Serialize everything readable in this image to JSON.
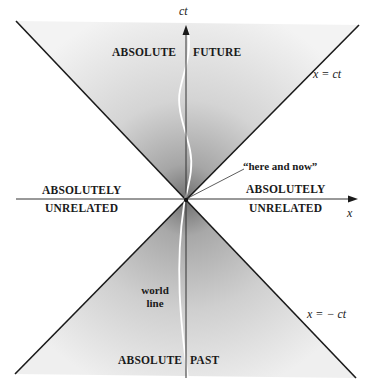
{
  "diagram": {
    "axes": {
      "vertical_label": "ct",
      "horizontal_label": "x"
    },
    "cone_lines": {
      "future_boundary": "x = ct",
      "past_boundary": "x = − ct"
    },
    "regions": {
      "future_left": "ABSOLUTE",
      "future_right": "FUTURE",
      "past_left": "ABSOLUTE",
      "past_right": "PAST",
      "left_line1": "ABSOLUTELY",
      "left_line2": "UNRELATED",
      "right_line1": "ABSOLUTELY",
      "right_line2": "UNRELATED"
    },
    "annotations": {
      "origin": "“here and now”",
      "world_line_1": "world",
      "world_line_2": "line"
    },
    "colors": {
      "cone_dark": "#8a8a8a",
      "cone_light": "#f2f2f2",
      "line": "#1a1a1a",
      "world_line": "#ffffff"
    }
  }
}
